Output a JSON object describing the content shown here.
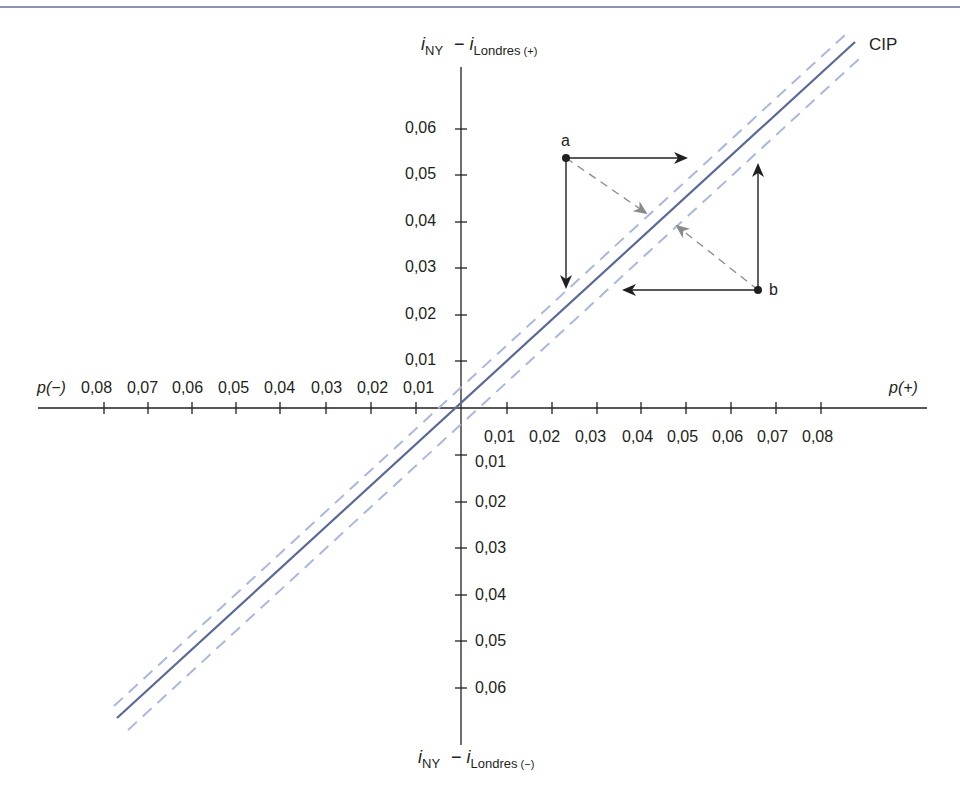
{
  "diagram": {
    "title_line": "CIP",
    "y_axis": {
      "top_label": {
        "i": "i",
        "ny": "NY",
        "minus": "−",
        "i2": "i",
        "londres": "Londres",
        "sign": "(+)"
      },
      "bottom_label": {
        "i": "i",
        "ny": "NY",
        "minus": "−",
        "i2": "i",
        "londres": "Londres",
        "sign": "(−)"
      },
      "positive_ticks": [
        "0,01",
        "0,02",
        "0,03",
        "0,04",
        "0,05",
        "0,06"
      ],
      "negative_ticks": [
        "0,01",
        "0,02",
        "0,03",
        "0,04",
        "0,05",
        "0,06"
      ]
    },
    "x_axis": {
      "left_label": "p(−)",
      "right_label": "p(+)",
      "negative_ticks": [
        "0,08",
        "0,07",
        "0,06",
        "0,05",
        "0,04",
        "0,03",
        "0,02",
        "0,01"
      ],
      "positive_ticks": [
        "0,01",
        "0,02",
        "0,03",
        "0,04",
        "0,05",
        "0,06",
        "0,07",
        "0,08"
      ]
    },
    "points": [
      {
        "name": "a",
        "x": 0.023,
        "y": 0.054
      },
      {
        "name": "b",
        "x": 0.066,
        "y": 0.025
      }
    ],
    "colors": {
      "cip_line": "#5a6a96",
      "dashed_band": "#a9b8dc",
      "axis": "#231f20",
      "dashed_arrow": "#8a8a8a"
    }
  }
}
